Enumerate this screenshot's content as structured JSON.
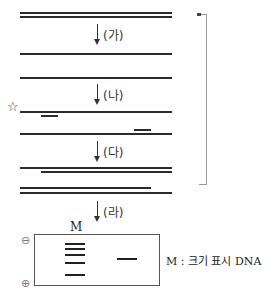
{
  "steps": [
    {
      "label": "(가)"
    },
    {
      "label": "(나)"
    },
    {
      "label": "(다)"
    },
    {
      "label": "(라)"
    }
  ],
  "star_symbol": "☆",
  "gel": {
    "lane_label": "M",
    "negative_symbol": "⊖",
    "positive_symbol": "⊕",
    "legend": "M : 크기 표시 DNA"
  }
}
